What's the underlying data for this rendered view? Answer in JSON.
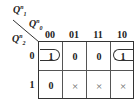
{
  "kmap": {
    "row_var": {
      "name": "Q",
      "sub": "2",
      "sup": "n"
    },
    "col_var_1": {
      "name": "Q",
      "sub": "1",
      "sup": "n"
    },
    "col_var_0": {
      "name": "Q",
      "sub": "0",
      "sup": "n"
    },
    "columns": [
      "00",
      "01",
      "11",
      "10"
    ],
    "rows": [
      "0",
      "1"
    ],
    "cells": [
      [
        "1",
        "0",
        "0",
        "1"
      ],
      [
        "0",
        "×",
        "×",
        "×"
      ]
    ],
    "groupings": [
      {
        "row": 0,
        "cols": [
          0,
          3
        ],
        "type": "wrap-around",
        "description": "Loop combining cells 00 and 10 in row 0"
      }
    ]
  }
}
